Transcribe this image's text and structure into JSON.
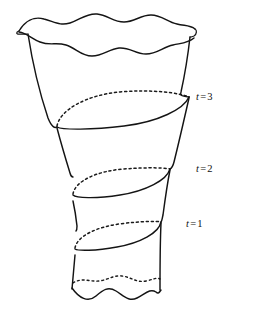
{
  "figure": {
    "kind": "line-drawing",
    "background_color": "#ffffff",
    "ink_color": "#141414"
  },
  "labels": [
    {
      "id": "t3",
      "variable": "t",
      "relation": "=",
      "value": "3",
      "text": "t = 3"
    },
    {
      "id": "t2",
      "variable": "t",
      "relation": "=",
      "value": "2",
      "text": "t = 2"
    },
    {
      "id": "t1",
      "variable": "t",
      "relation": "=",
      "value": "1",
      "text": "t = 1"
    }
  ],
  "cross_sections": [
    {
      "label": "t = 3",
      "front_arc": "solid",
      "back_arc": "dotted"
    },
    {
      "label": "t = 2",
      "front_arc": "solid",
      "back_arc": "dotted"
    },
    {
      "label": "t = 1",
      "front_arc": "solid",
      "back_arc": "dotted"
    }
  ],
  "edges": {
    "top_rim": "wavy torn edge",
    "bottom_rim": "wavy torn edge",
    "bottom_back_rim": "dotted wavy edge"
  }
}
